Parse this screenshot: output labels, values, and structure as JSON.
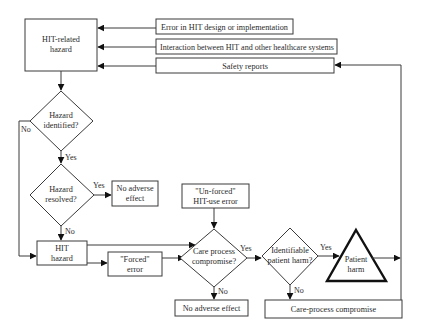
{
  "diagram": {
    "nodes": {
      "hit_related_hazard": {
        "line1": "HIT-related",
        "line2": "hazard"
      },
      "error_hit_design": {
        "label": "Error in HIT design or implementation"
      },
      "interaction": {
        "label": "Interaction between HIT and other healthcare systems"
      },
      "safety_reports": {
        "label": "Safety reports"
      },
      "hazard_identified": {
        "line1": "Hazard",
        "line2": "identified?"
      },
      "hazard_resolved": {
        "line1": "Hazard",
        "line2": "resolved?"
      },
      "no_adverse_effect_1": {
        "line1": "No adverse",
        "line2": "effect"
      },
      "hit_hazard": {
        "line1": "HIT",
        "line2": "hazard"
      },
      "forced_error": {
        "line1": "\"Forced\"",
        "line2": "error"
      },
      "unforced_error": {
        "line1": "\"Un-forced\"",
        "line2": "HIT-use error"
      },
      "care_process_compromise_q": {
        "line1": "Care process",
        "line2": "compromise?"
      },
      "identifiable_harm": {
        "line1": "Identifiable",
        "line2": "patient harm?"
      },
      "patient_harm": {
        "line1": "Patient",
        "line2": "harm"
      },
      "no_adverse_effect_2": {
        "label": "No adverse effect"
      },
      "care_process_compromise": {
        "label": "Care-process compromise"
      }
    },
    "edge_labels": {
      "identified_no": "No",
      "identified_yes": "Yes",
      "resolved_yes": "Yes",
      "resolved_no": "No",
      "care_yes": "Yes",
      "care_no": "No",
      "harm_yes": "Yes",
      "harm_no": "No"
    }
  }
}
